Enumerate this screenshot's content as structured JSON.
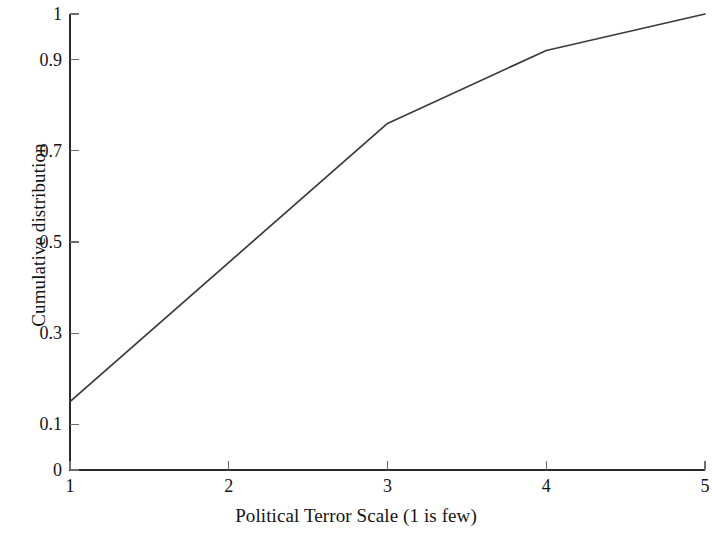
{
  "chart_data": {
    "type": "line",
    "title": "",
    "subtitle": "",
    "xlabel": "Political Terror Scale (1 is few)",
    "ylabel": "Cumulative distribution",
    "x": [
      1,
      2,
      3,
      4,
      5
    ],
    "values": [
      0.15,
      0.465,
      0.76,
      0.92,
      1.0
    ],
    "series": [
      {
        "name": "Cumulative distribution",
        "values": [
          0.15,
          0.465,
          0.76,
          0.92,
          1.0
        ]
      }
    ],
    "vertices": [
      {
        "x": 1,
        "y": 0.15
      },
      {
        "x": 3,
        "y": 0.76
      },
      {
        "x": 4,
        "y": 0.92
      },
      {
        "x": 5,
        "y": 1.0
      }
    ],
    "xlim": [
      1,
      5
    ],
    "ylim": [
      0,
      1
    ],
    "xticks": [
      1,
      2,
      3,
      4,
      5
    ],
    "xtick_labels": [
      "1",
      "2",
      "3",
      "4",
      "5"
    ],
    "yticks": [
      0,
      0.1,
      0.3,
      0.5,
      0.7,
      0.9,
      1
    ],
    "ytick_labels": [
      "0",
      "0.1",
      "0.3",
      "0.5",
      "0.7",
      "0.9",
      "1"
    ],
    "grid": false,
    "legend": null,
    "legend_position": "none",
    "line_color": "#3a3a3a",
    "axis_color": "#2b2b2b",
    "background_color": "#ffffff"
  }
}
